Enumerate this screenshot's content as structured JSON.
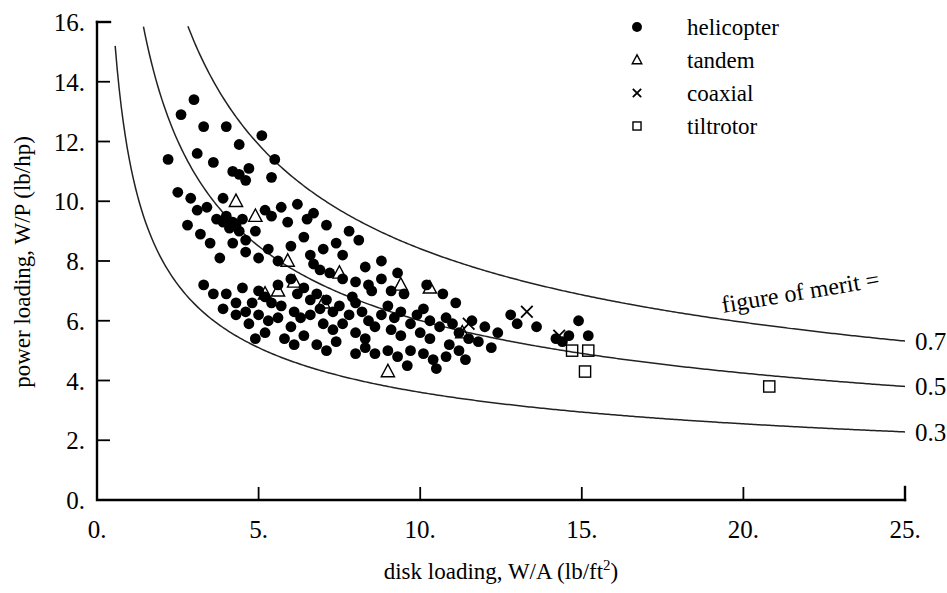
{
  "chart_data": {
    "type": "scatter",
    "title": "",
    "xlabel": "disk loading, W/A (lb/ft2)",
    "xlabel_main": "disk loading, W/A (lb/ft",
    "xlabel_sup": "2",
    "xlabel_tail": ")",
    "ylabel": "power loading, W/P (lb/hp)",
    "xlim": [
      0,
      25
    ],
    "ylim": [
      0,
      16
    ],
    "xticks": [
      "0.",
      "5.",
      "10.",
      "15.",
      "20.",
      "25."
    ],
    "xtick_values": [
      0,
      5,
      10,
      15,
      20,
      25
    ],
    "yticks": [
      "0.",
      "2.",
      "4.",
      "6.",
      "8.",
      "10.",
      "12.",
      "14.",
      "16."
    ],
    "ytick_values": [
      0,
      2,
      4,
      6,
      8,
      10,
      12,
      14,
      16
    ],
    "grid": false,
    "legend_position": "top-right",
    "annotation": "figure of merit = 0.7",
    "annotation_prefix": "figure of merit =",
    "series": [
      {
        "name": "helicopter",
        "marker": "filled-circle",
        "points": [
          [
            2.6,
            12.9
          ],
          [
            3.0,
            13.4
          ],
          [
            3.3,
            12.5
          ],
          [
            4.0,
            12.5
          ],
          [
            4.4,
            11.9
          ],
          [
            5.1,
            12.2
          ],
          [
            3.6,
            11.3
          ],
          [
            4.2,
            11.0
          ],
          [
            4.4,
            10.9
          ],
          [
            4.6,
            10.7
          ],
          [
            4.7,
            11.1
          ],
          [
            5.4,
            10.8
          ],
          [
            5.5,
            11.4
          ],
          [
            2.9,
            10.1
          ],
          [
            3.4,
            9.8
          ],
          [
            3.7,
            9.4
          ],
          [
            3.9,
            9.3
          ],
          [
            4.0,
            9.5
          ],
          [
            4.1,
            9.1
          ],
          [
            4.2,
            9.3
          ],
          [
            4.3,
            9.2
          ],
          [
            4.4,
            9.0
          ],
          [
            4.5,
            9.4
          ],
          [
            4.2,
            8.6
          ],
          [
            4.6,
            8.7
          ],
          [
            3.5,
            8.6
          ],
          [
            4.9,
            9.0
          ],
          [
            5.2,
            9.7
          ],
          [
            5.4,
            9.5
          ],
          [
            5.7,
            9.8
          ],
          [
            6.2,
            9.9
          ],
          [
            6.5,
            9.4
          ],
          [
            3.8,
            8.1
          ],
          [
            4.6,
            8.3
          ],
          [
            5.0,
            8.1
          ],
          [
            5.3,
            8.4
          ],
          [
            5.6,
            8.0
          ],
          [
            6.0,
            8.5
          ],
          [
            6.6,
            8.2
          ],
          [
            7.0,
            8.4
          ],
          [
            6.7,
            7.9
          ],
          [
            7.4,
            8.6
          ],
          [
            7.8,
            9.0
          ],
          [
            8.1,
            8.7
          ],
          [
            3.3,
            7.2
          ],
          [
            3.6,
            6.9
          ],
          [
            4.0,
            6.9
          ],
          [
            4.3,
            6.6
          ],
          [
            4.5,
            7.1
          ],
          [
            4.8,
            6.6
          ],
          [
            5.0,
            7.0
          ],
          [
            5.2,
            6.8
          ],
          [
            5.4,
            6.6
          ],
          [
            5.6,
            7.2
          ],
          [
            5.0,
            6.2
          ],
          [
            5.3,
            6.0
          ],
          [
            5.6,
            6.1
          ],
          [
            4.6,
            6.3
          ],
          [
            4.3,
            6.2
          ],
          [
            3.9,
            6.4
          ],
          [
            6.0,
            7.4
          ],
          [
            6.2,
            6.9
          ],
          [
            6.4,
            7.1
          ],
          [
            6.6,
            6.7
          ],
          [
            6.8,
            6.9
          ],
          [
            6.1,
            6.3
          ],
          [
            6.3,
            6.1
          ],
          [
            6.6,
            6.2
          ],
          [
            6.9,
            6.4
          ],
          [
            7.1,
            6.7
          ],
          [
            7.3,
            6.3
          ],
          [
            7.5,
            6.5
          ],
          [
            7.0,
            5.9
          ],
          [
            7.3,
            5.7
          ],
          [
            7.6,
            5.9
          ],
          [
            7.8,
            6.2
          ],
          [
            8.0,
            6.6
          ],
          [
            8.2,
            6.3
          ],
          [
            8.4,
            6.0
          ],
          [
            8.0,
            5.6
          ],
          [
            8.3,
            5.4
          ],
          [
            8.6,
            5.8
          ],
          [
            8.8,
            6.2
          ],
          [
            9.0,
            6.5
          ],
          [
            9.2,
            6.1
          ],
          [
            9.4,
            6.3
          ],
          [
            9.1,
            5.7
          ],
          [
            9.4,
            5.5
          ],
          [
            9.7,
            5.9
          ],
          [
            9.9,
            6.2
          ],
          [
            10.1,
            6.4
          ],
          [
            10.3,
            6.0
          ],
          [
            10.0,
            5.6
          ],
          [
            10.3,
            5.4
          ],
          [
            10.6,
            5.8
          ],
          [
            10.8,
            6.1
          ],
          [
            11.0,
            5.9
          ],
          [
            11.2,
            5.6
          ],
          [
            10.9,
            5.2
          ],
          [
            11.2,
            5.0
          ],
          [
            11.5,
            5.4
          ],
          [
            7.6,
            7.4
          ],
          [
            8.0,
            7.3
          ],
          [
            8.4,
            7.2
          ],
          [
            8.8,
            7.4
          ],
          [
            9.1,
            7.0
          ],
          [
            9.5,
            6.9
          ],
          [
            6.8,
            5.2
          ],
          [
            7.1,
            5.0
          ],
          [
            7.4,
            5.3
          ],
          [
            8.0,
            4.9
          ],
          [
            8.3,
            5.1
          ],
          [
            8.6,
            4.9
          ],
          [
            9.0,
            5.0
          ],
          [
            9.3,
            4.8
          ],
          [
            9.7,
            5.0
          ],
          [
            10.1,
            4.9
          ],
          [
            10.4,
            4.7
          ],
          [
            10.8,
            4.8
          ],
          [
            11.4,
            4.7
          ],
          [
            5.8,
            5.4
          ],
          [
            6.1,
            5.2
          ],
          [
            6.4,
            5.5
          ],
          [
            5.2,
            5.6
          ],
          [
            4.9,
            5.4
          ],
          [
            12.0,
            5.8
          ],
          [
            12.4,
            5.6
          ],
          [
            13.0,
            5.9
          ],
          [
            13.6,
            5.8
          ],
          [
            14.2,
            5.4
          ],
          [
            14.4,
            5.3
          ],
          [
            14.6,
            5.5
          ],
          [
            15.2,
            5.5
          ],
          [
            14.9,
            6.0
          ],
          [
            12.8,
            6.2
          ],
          [
            5.9,
            9.3
          ],
          [
            6.4,
            8.8
          ],
          [
            7.1,
            9.2
          ],
          [
            7.6,
            8.2
          ],
          [
            8.3,
            7.8
          ],
          [
            8.8,
            8.0
          ],
          [
            9.3,
            7.6
          ],
          [
            10.2,
            7.2
          ],
          [
            10.7,
            6.9
          ],
          [
            11.1,
            6.6
          ],
          [
            2.2,
            11.4
          ],
          [
            2.5,
            10.3
          ],
          [
            3.1,
            9.7
          ],
          [
            3.2,
            8.9
          ],
          [
            2.8,
            9.2
          ],
          [
            6.9,
            7.7
          ],
          [
            7.2,
            7.6
          ],
          [
            5.7,
            6.5
          ],
          [
            6.0,
            5.8
          ],
          [
            4.7,
            5.9
          ],
          [
            11.6,
            6.0
          ],
          [
            11.8,
            5.3
          ],
          [
            12.2,
            5.1
          ],
          [
            9.6,
            4.5
          ],
          [
            10.5,
            4.4
          ],
          [
            3.1,
            11.6
          ],
          [
            3.9,
            10.1
          ],
          [
            6.7,
            9.6
          ],
          [
            7.9,
            6.8
          ],
          [
            8.5,
            7.0
          ]
        ]
      },
      {
        "name": "tandem",
        "marker": "open-triangle",
        "points": [
          [
            4.3,
            10.0
          ],
          [
            4.9,
            9.5
          ],
          [
            5.9,
            8.0
          ],
          [
            6.1,
            7.3
          ],
          [
            7.5,
            7.6
          ],
          [
            5.2,
            6.9
          ],
          [
            7.0,
            6.6
          ],
          [
            9.4,
            7.2
          ],
          [
            10.3,
            7.1
          ],
          [
            9.0,
            4.3
          ],
          [
            11.3,
            5.6
          ],
          [
            5.6,
            7.0
          ]
        ]
      },
      {
        "name": "coaxial",
        "marker": "cross",
        "points": [
          [
            13.3,
            6.3
          ],
          [
            14.3,
            5.5
          ],
          [
            11.5,
            5.9
          ]
        ]
      },
      {
        "name": "tiltrotor",
        "marker": "open-square",
        "points": [
          [
            14.7,
            5.0
          ],
          [
            15.2,
            5.0
          ],
          [
            15.1,
            4.3
          ],
          [
            20.8,
            3.8
          ]
        ]
      }
    ],
    "curves": [
      {
        "label": "0.7",
        "figure_of_merit": 0.7,
        "description": "upper figure of merit curve"
      },
      {
        "label": "0.5",
        "figure_of_merit": 0.5,
        "description": "middle figure of merit curve"
      },
      {
        "label": "0.3",
        "figure_of_merit": 0.3,
        "description": "lower figure of merit curve"
      }
    ]
  },
  "legend": {
    "items": [
      {
        "label": "helicopter",
        "marker": "filled-circle"
      },
      {
        "label": "tandem",
        "marker": "open-triangle"
      },
      {
        "label": "coaxial",
        "marker": "cross"
      },
      {
        "label": "tiltrotor",
        "marker": "open-square"
      }
    ]
  },
  "colors": {
    "background": "#ffffff",
    "ink": "#000000",
    "curve": "#222222"
  }
}
